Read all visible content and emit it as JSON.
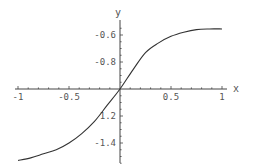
{
  "chart_data": {
    "type": "line",
    "title": "",
    "xlabel": "x",
    "ylabel": "y",
    "xlim": [
      -1,
      1
    ],
    "ylim": [
      -1.55,
      -0.55
    ],
    "axes_origin": {
      "x": 0,
      "y": -1
    },
    "grid": false,
    "x_ticks": [
      -1,
      -0.5,
      0.5,
      1
    ],
    "x_tick_labels": [
      "-1",
      "-0.5",
      "0.5",
      "1"
    ],
    "y_ticks": [
      -0.6,
      -0.8,
      -1.2,
      -1.4
    ],
    "y_tick_labels": [
      "-0.6",
      "-0.8",
      "1.2",
      "-1.4"
    ],
    "series": [
      {
        "name": "curve",
        "color": "#333333",
        "x": [
          -1,
          -0.875,
          -0.75,
          -0.625,
          -0.5,
          -0.375,
          -0.25,
          -0.125,
          0,
          0.125,
          0.25,
          0.375,
          0.5,
          0.625,
          0.75,
          0.875,
          1
        ],
        "y": [
          -1.53,
          -1.51,
          -1.48,
          -1.45,
          -1.4,
          -1.33,
          -1.24,
          -1.12,
          -1.0,
          -0.86,
          -0.73,
          -0.66,
          -0.61,
          -0.58,
          -0.56,
          -0.555,
          -0.555
        ]
      }
    ]
  }
}
